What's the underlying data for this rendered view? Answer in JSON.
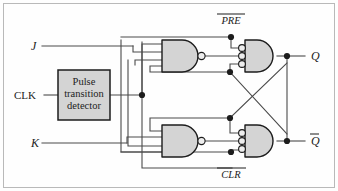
{
  "figure": {
    "background_color": "#fefefe",
    "frame_color": "#b9b9b9",
    "wire_color": "#4a4a4a",
    "gate_fill": "#d4d4d4",
    "gate_stroke": "#1c1c1c"
  },
  "inputs": {
    "j": "J",
    "k": "K",
    "clk": "CLK",
    "preset": "PRE",
    "clear": "CLR"
  },
  "outputs": {
    "q": "Q",
    "q_not": "Q"
  },
  "block": {
    "line1": "Pulse",
    "line2": "transition",
    "line3": "detector"
  },
  "gates": {
    "nand_top": "nand-gate-top",
    "nand_bottom": "nand-gate-bottom",
    "out_top": "negative-and-gate-top",
    "out_bottom": "negative-and-gate-bottom"
  }
}
